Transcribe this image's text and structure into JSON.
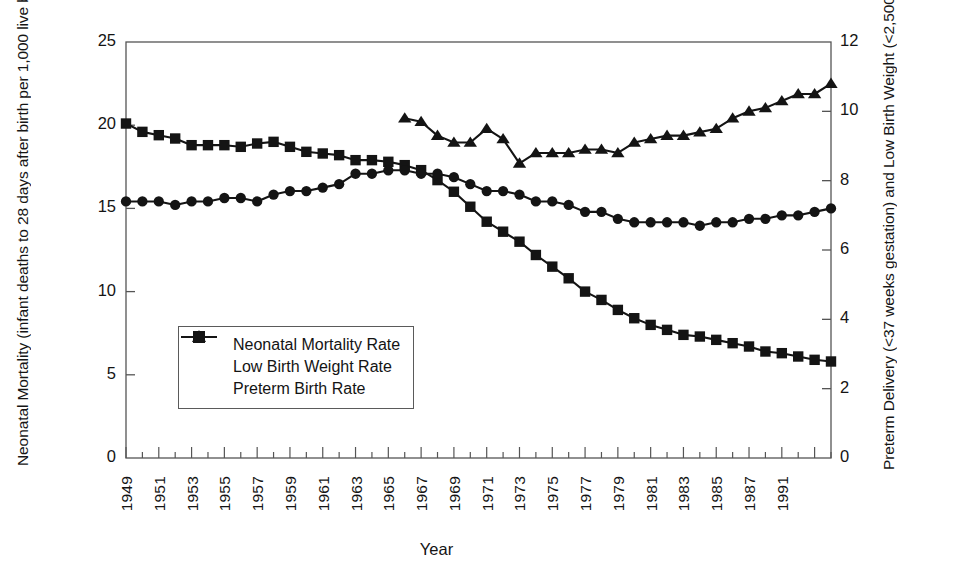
{
  "chart_data": {
    "type": "line",
    "title": "",
    "xlabel": "Year",
    "ylabel_left": "Neonatal Mortality (infant deaths to 28 days after birth per 1,000 live births)",
    "ylabel_right": "Preterm Delivery (<37 weeks gestation) and Low Birth Weight (<2,500 grams) (per 100 live births)",
    "ylim_left": [
      0,
      25
    ],
    "ylim_right": [
      0,
      12
    ],
    "yticks_left": [
      "0",
      "5",
      "10",
      "15",
      "20",
      "25"
    ],
    "yticks_left_values": [
      0,
      5,
      10,
      15,
      20,
      25
    ],
    "yticks_right": [
      "0",
      "2",
      "4",
      "6",
      "8",
      "10",
      "12"
    ],
    "yticks_right_values": [
      0,
      2,
      4,
      6,
      8,
      10,
      12
    ],
    "grid": false,
    "legend_position": "inside-lower-left",
    "xlim": [
      1949,
      1992
    ],
    "xtick_labels": [
      "1949",
      "1951",
      "1953",
      "1955",
      "1957",
      "1959",
      "1961",
      "1963",
      "1965",
      "1967",
      "1969",
      "1971",
      "1973",
      "1975",
      "1977",
      "1979",
      "1981",
      "1983",
      "1985",
      "1987",
      "1991"
    ],
    "xtick_values": [
      1949,
      1951,
      1953,
      1955,
      1957,
      1959,
      1961,
      1963,
      1965,
      1967,
      1969,
      1971,
      1973,
      1975,
      1977,
      1979,
      1981,
      1983,
      1985,
      1987,
      1989
    ],
    "series": [
      {
        "name": "Neonatal Mortality Rate",
        "marker": "square",
        "axis": "left",
        "x": [
          1949,
          1950,
          1951,
          1952,
          1953,
          1954,
          1955,
          1956,
          1957,
          1958,
          1959,
          1960,
          1961,
          1962,
          1963,
          1964,
          1965,
          1966,
          1967,
          1968,
          1969,
          1970,
          1971,
          1972,
          1973,
          1974,
          1975,
          1976,
          1977,
          1978,
          1979,
          1980,
          1981,
          1982,
          1983,
          1984,
          1985,
          1986,
          1987,
          1988,
          1989,
          1990,
          1991,
          1992
        ],
        "values": [
          20.1,
          19.6,
          19.4,
          19.2,
          18.8,
          18.8,
          18.8,
          18.7,
          18.9,
          19.0,
          18.7,
          18.4,
          18.3,
          18.2,
          17.9,
          17.9,
          17.8,
          17.6,
          17.3,
          16.7,
          16.0,
          15.1,
          14.2,
          13.6,
          13.0,
          12.2,
          11.5,
          10.8,
          10.0,
          9.5,
          8.9,
          8.4,
          8.0,
          7.7,
          7.4,
          7.3,
          7.1,
          6.9,
          6.7,
          6.4,
          6.3,
          6.1,
          5.9,
          5.8
        ]
      },
      {
        "name": "Low Birth Weight Rate",
        "marker": "circle",
        "axis": "right",
        "x": [
          1949,
          1950,
          1951,
          1952,
          1953,
          1954,
          1955,
          1956,
          1957,
          1958,
          1959,
          1960,
          1961,
          1962,
          1963,
          1964,
          1965,
          1966,
          1967,
          1968,
          1969,
          1970,
          1971,
          1972,
          1973,
          1974,
          1975,
          1976,
          1977,
          1978,
          1979,
          1980,
          1981,
          1982,
          1983,
          1984,
          1985,
          1986,
          1987,
          1988,
          1989,
          1990,
          1991,
          1992
        ],
        "values": [
          7.4,
          7.4,
          7.4,
          7.3,
          7.4,
          7.4,
          7.5,
          7.5,
          7.4,
          7.6,
          7.7,
          7.7,
          7.8,
          7.9,
          8.2,
          8.2,
          8.3,
          8.3,
          8.2,
          8.2,
          8.1,
          7.9,
          7.7,
          7.7,
          7.6,
          7.4,
          7.4,
          7.3,
          7.1,
          7.1,
          6.9,
          6.8,
          6.8,
          6.8,
          6.8,
          6.7,
          6.8,
          6.8,
          6.9,
          6.9,
          7.0,
          7.0,
          7.1,
          7.2
        ]
      },
      {
        "name": "Preterm Birth Rate",
        "marker": "triangle",
        "axis": "right",
        "x": [
          1966,
          1967,
          1968,
          1969,
          1970,
          1971,
          1972,
          1973,
          1974,
          1975,
          1976,
          1977,
          1978,
          1979,
          1980,
          1981,
          1982,
          1983,
          1984,
          1985,
          1986,
          1987,
          1988,
          1989,
          1990,
          1991,
          1992
        ],
        "values": [
          9.8,
          9.7,
          9.3,
          9.1,
          9.1,
          9.5,
          9.2,
          8.5,
          8.8,
          8.8,
          8.8,
          8.9,
          8.9,
          8.8,
          9.1,
          9.2,
          9.3,
          9.3,
          9.4,
          9.5,
          9.8,
          10.0,
          10.1,
          10.3,
          10.5,
          10.5,
          10.8
        ]
      }
    ]
  },
  "legend": {
    "items": [
      {
        "label": "Neonatal Mortality Rate",
        "marker": "square"
      },
      {
        "label": "Low Birth Weight Rate",
        "marker": "circle"
      },
      {
        "label": "Preterm Birth Rate",
        "marker": "triangle"
      }
    ]
  },
  "colors": {
    "ink": "#141414",
    "axis": "#555555",
    "background": "#ffffff"
  }
}
